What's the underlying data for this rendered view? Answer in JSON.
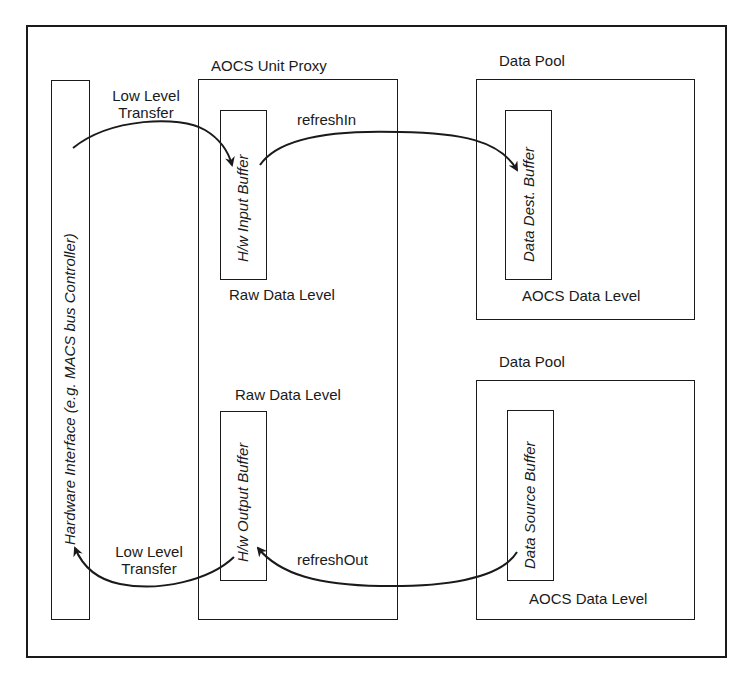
{
  "diagram": {
    "frame": "outer-frame",
    "hardware_interface": {
      "label_italic_prefix": "Hardware Interface (e.g. ",
      "label_italic_mid": "MACS",
      "label_italic_suffix": " bus Controller)",
      "full_label": "Hardware Interface (e.g. MACS bus Controller)"
    },
    "aocs_unit_proxy": {
      "title": "AOCS Unit Proxy",
      "input_buffer": {
        "label": "H/w Input Buffer",
        "level": "Raw Data Level"
      },
      "output_buffer": {
        "label": "H/w Output Buffer",
        "level": "Raw Data Level"
      }
    },
    "data_pool_top": {
      "title": "Data Pool",
      "buffer": {
        "label_upright": "Data Dest. ",
        "label_italic": "Buffer",
        "full_label": "Data Dest. Buffer"
      },
      "level": "AOCS Data Level"
    },
    "data_pool_bottom": {
      "title": "Data Pool",
      "buffer": {
        "label_upright": "Data Source ",
        "label_italic": "Buffer",
        "full_label": "Data Source Buffer"
      },
      "level": "AOCS Data Level"
    },
    "arrows": [
      {
        "id": "low-level-transfer-in",
        "label_line1": "Low Level",
        "label_line2": "Transfer",
        "from": "Hardware Interface",
        "to": "H/w Input Buffer"
      },
      {
        "id": "refresh-in",
        "label": "refreshIn",
        "from": "H/w Input Buffer",
        "to": "Data Dest. Buffer"
      },
      {
        "id": "low-level-transfer-out",
        "label_line1": "Low Level",
        "label_line2": "Transfer",
        "from": "H/w Output Buffer",
        "to": "Hardware Interface"
      },
      {
        "id": "refresh-out",
        "label": "refreshOut",
        "from": "Data Source Buffer",
        "to": "H/w Output Buffer"
      }
    ],
    "colors": {
      "stroke": "#1a1a1a",
      "background": "#ffffff"
    }
  }
}
